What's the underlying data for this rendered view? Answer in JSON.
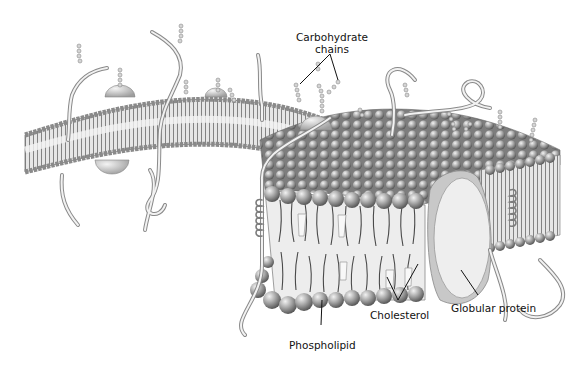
{
  "diagram": {
    "type": "cell-membrane-illustration",
    "style": "grayscale",
    "colors": {
      "background": "#ffffff",
      "head_light": "#d8d8d8",
      "head_mid": "#9a9a9a",
      "head_dark": "#5c5c5c",
      "tail": "#4a4a4a",
      "interior": "#eeeeee",
      "protein": "#e9e9e9",
      "line": "#111111"
    },
    "labels": {
      "carbohydrate": {
        "line1": "Carbohydrate",
        "line2": "chains"
      },
      "globular_protein": "Globular protein",
      "cholesterol": "Cholesterol",
      "phospholipid": "Phospholipid"
    }
  }
}
